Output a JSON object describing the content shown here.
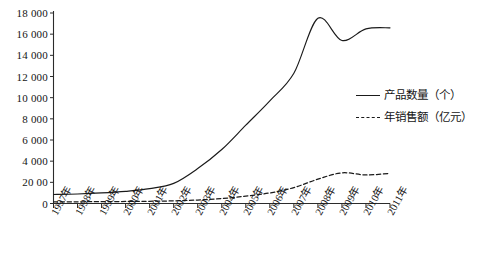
{
  "chart_data": {
    "type": "line",
    "title": "",
    "subtitle": "",
    "xlabel": "",
    "ylabel": "",
    "xlim": [
      0,
      14
    ],
    "ylim": [
      0,
      18000
    ],
    "grid": false,
    "legend_position": "right-outside",
    "y_ticks": [
      0,
      2000,
      4000,
      6000,
      8000,
      10000,
      12000,
      14000,
      16000,
      18000
    ],
    "y_tick_labels": [
      "0",
      "20 00",
      "4 000",
      "6 000",
      "8 000",
      "10 000",
      "12 000",
      "14 000",
      "16 000",
      "18 000"
    ],
    "categories": [
      "1997年",
      "1998年",
      "1999年",
      "2000年",
      "2001年",
      "2002年",
      "2003年",
      "2004年",
      "2005年",
      "2006年",
      "2007年",
      "2008年",
      "2009年",
      "2010年",
      "2011年"
    ],
    "series": [
      {
        "name": "产品数量（个）",
        "style": "solid",
        "color": "#1a1a1a",
        "values": [
          850,
          900,
          1000,
          1150,
          1400,
          1900,
          3300,
          5100,
          7400,
          9700,
          12300,
          17500,
          15400,
          16500,
          16600
        ]
      },
      {
        "name": "年销售额（亿元）",
        "style": "dashed",
        "color": "#1a1a1a",
        "values": [
          150,
          160,
          175,
          190,
          210,
          250,
          330,
          470,
          700,
          1000,
          1500,
          2300,
          2900,
          2700,
          2850
        ]
      }
    ]
  },
  "legend": {
    "items": [
      {
        "label": "产品数量（个）",
        "style": "solid"
      },
      {
        "label": "年销售额（亿元）",
        "style": "dashed"
      }
    ]
  }
}
